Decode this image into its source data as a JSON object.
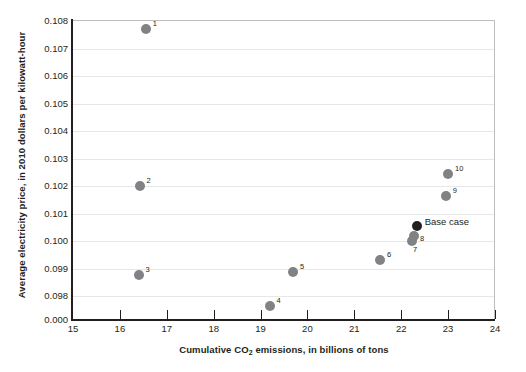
{
  "chart_data": {
    "type": "scatter",
    "title": "",
    "xlabel": "Cumulative CO2 emissions, in billions of tons",
    "xlabel_parts": {
      "pre": "Cumulative CO",
      "sub": "2",
      "post": " emissions, in billions of tons"
    },
    "ylabel": "Average electricity price, in 2010 dollars per kilowatt-hour",
    "xlim": [
      15,
      24
    ],
    "ylim": [
      0.0975,
      0.108
    ],
    "y_axis_broken": true,
    "grid": true,
    "grid_axis": "y",
    "legend": "none",
    "xticks": [
      15,
      16,
      17,
      18,
      19,
      20,
      21,
      22,
      23,
      24
    ],
    "xtick_labels": [
      "15",
      "16",
      "17",
      "18",
      "19",
      "20",
      "21",
      "22",
      "23",
      "24"
    ],
    "yticks": [
      0.098,
      0.099,
      0.1,
      0.101,
      0.102,
      0.103,
      0.104,
      0.105,
      0.106,
      0.107,
      0.108
    ],
    "ytick_labels": [
      "0.000",
      "0.098",
      "0.099",
      "0.100",
      "0.101",
      "0.102",
      "0.103",
      "0.104",
      "0.105",
      "0.106",
      "0.107",
      "0.108"
    ],
    "y_break_label": "0.000",
    "marker_color": "#808285",
    "base_case_color": "#231f20",
    "points": [
      {
        "label": "1",
        "x": 16.55,
        "y": 0.10772,
        "is_base_case": false,
        "label_dx": 7,
        "label_dy": -9
      },
      {
        "label": "2",
        "x": 16.42,
        "y": 0.102,
        "is_base_case": false,
        "label_dx": 7,
        "label_dy": -9
      },
      {
        "label": "3",
        "x": 16.4,
        "y": 0.09875,
        "is_base_case": false,
        "label_dx": 7,
        "label_dy": -9
      },
      {
        "label": "4",
        "x": 19.19,
        "y": 0.09765,
        "is_base_case": false,
        "label_dx": 7,
        "label_dy": -9
      },
      {
        "label": "5",
        "x": 19.69,
        "y": 0.09888,
        "is_base_case": false,
        "label_dx": 7,
        "label_dy": -9
      },
      {
        "label": "6",
        "x": 21.55,
        "y": 0.09932,
        "is_base_case": false,
        "label_dx": 7,
        "label_dy": -9
      },
      {
        "label": "7",
        "x": 22.23,
        "y": 0.1,
        "is_base_case": false,
        "label_dx": 1,
        "label_dy": 5
      },
      {
        "label": "8",
        "x": 22.27,
        "y": 0.10018,
        "is_base_case": false,
        "label_dx": 6,
        "label_dy": -1
      },
      {
        "label": "Base case",
        "x": 22.33,
        "y": 0.10053,
        "is_base_case": true,
        "label_dx": 8,
        "label_dy": -8
      },
      {
        "label": "9",
        "x": 22.95,
        "y": 0.10163,
        "is_base_case": false,
        "label_dx": 7,
        "label_dy": -9
      },
      {
        "label": "10",
        "x": 23.0,
        "y": 0.10245,
        "is_base_case": false,
        "label_dx": 7,
        "label_dy": -9
      }
    ]
  }
}
